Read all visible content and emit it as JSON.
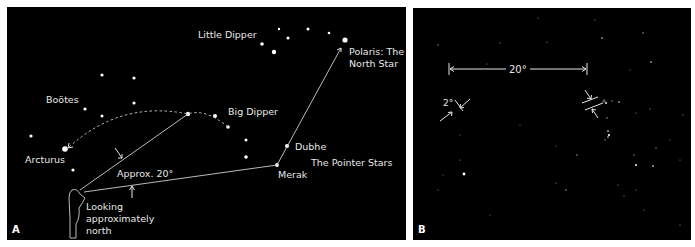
{
  "panel_a": {
    "letter": "A",
    "labels": {
      "little_dipper": "Little Dipper",
      "polaris_line1": "Polaris: The",
      "polaris_line2": "North Star",
      "bootes": "Boötes",
      "big_dipper": "Big Dipper",
      "dubhe": "Dubhe",
      "pointer_stars": "The Pointer Stars",
      "arcturus": "Arcturus",
      "approx": "Approx. 20°",
      "merak": "Merak",
      "looking_line1": "Looking",
      "looking_line2": "approximately",
      "looking_line3": "north"
    }
  },
  "panel_b": {
    "letter": "B",
    "labels": {
      "twenty_deg": "20°",
      "two_deg": "2°"
    }
  },
  "colors": {
    "sky": "#000000",
    "frame": "#ffffff",
    "text": "#e8e8e8",
    "lines": "#cfcfcf"
  }
}
